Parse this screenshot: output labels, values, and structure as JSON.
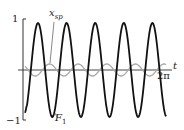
{
  "figure": {
    "y_top_label": "1",
    "y_bottom_label": "−1",
    "x_axis_label": "t",
    "x_end_label": "2π",
    "curve_labels": {
      "x_sp": "x",
      "x_sp_sub": "sp",
      "F1": "F",
      "F1_sub": "1"
    },
    "colors": {
      "F1": "#111111",
      "x_sp": "#a8a8a8",
      "axis": "#333333"
    }
  },
  "chart_data": {
    "type": "line",
    "title": "",
    "xlabel": "t",
    "ylabel": "",
    "xlim": [
      0,
      6.2832
    ],
    "ylim": [
      -1,
      1
    ],
    "x_tick_labels": [
      "2π"
    ],
    "y_tick_labels": [
      "1",
      "−1"
    ],
    "grid": false,
    "legend": "inline labels",
    "series": [
      {
        "name": "F1",
        "description": "large amplitude oscillation, approx -cos(5t)",
        "amplitude": 0.95,
        "cycles": 5,
        "color": "#111111"
      },
      {
        "name": "x_sp",
        "description": "small amplitude oscillation",
        "amplitude": 0.12,
        "cycles": 5,
        "color": "#a8a8a8"
      }
    ]
  }
}
